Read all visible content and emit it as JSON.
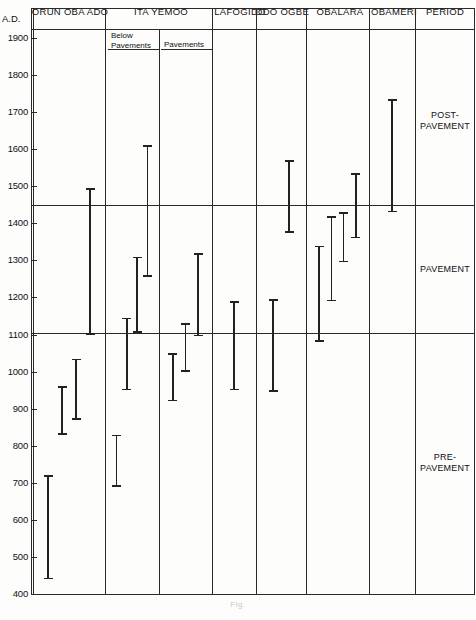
{
  "axis": {
    "unit_label": "A.D.",
    "ticks": [
      1900,
      1800,
      1700,
      1600,
      1500,
      1400,
      1300,
      1200,
      1100,
      1000,
      900,
      800,
      700,
      600,
      500,
      400
    ],
    "min": 400,
    "max": 1900
  },
  "columns": [
    {
      "key": "orun_oba_ado",
      "label": "ORUN OBA ADO",
      "sub": null
    },
    {
      "key": "ita_yemoo_below",
      "label": "ITA YEMOO",
      "sub": "Below\nPavements"
    },
    {
      "key": "ita_yemoo_pav",
      "label": "",
      "sub": "Pavements"
    },
    {
      "key": "lafogido",
      "label": "LAFOGIDO",
      "sub": null
    },
    {
      "key": "odo_ogbe",
      "label": "ODO OGBE",
      "sub": null
    },
    {
      "key": "obalara",
      "label": "OBALARA",
      "sub": null
    },
    {
      "key": "obameri",
      "label": "OBAMERI",
      "sub": null
    },
    {
      "key": "period",
      "label": "PERIOD",
      "sub": null
    }
  ],
  "header": {
    "axis_unit": "A.D.",
    "orun_oba_ado": "ORUN OBA ADO",
    "ita_yemoo": "ITA YEMOO",
    "ita_yemoo_below": "Below",
    "ita_yemoo_below2": "Pavements",
    "ita_yemoo_pavements": "Pavements",
    "lafogido": "LAFOGIDO",
    "odo_ogbe": "ODO OGBE",
    "obalara": "OBALARA",
    "obameri": "OBAMERI",
    "period": "PERIOD"
  },
  "periods": [
    {
      "label": "POST-\nPAVEMENT",
      "line1": "POST-",
      "line2": "PAVEMENT",
      "from": 1900,
      "to": 1450
    },
    {
      "label": "PAVEMENT",
      "line1": "PAVEMENT",
      "line2": "",
      "from": 1450,
      "to": 1105
    },
    {
      "label": "PRE-\nPAVEMENT",
      "line1": "PRE-",
      "line2": "PAVEMENT",
      "from": 1105,
      "to": 400
    }
  ],
  "chart_data": {
    "type": "range",
    "title": "",
    "xlabel": "",
    "ylabel": "A.D.",
    "ylim": [
      400,
      1900
    ],
    "yticks": [
      400,
      500,
      600,
      700,
      800,
      900,
      1000,
      1100,
      1200,
      1300,
      1400,
      1500,
      1600,
      1700,
      1800,
      1900
    ],
    "grid": false,
    "legend": "none",
    "categories": [
      "ORUN OBA ADO",
      "ITA YEMOO (Below Pavements)",
      "ITA YEMOO (Pavements)",
      "LAFOGIDO",
      "ODO OGBE",
      "OBALARA",
      "OBAMERI"
    ],
    "series": [
      {
        "name": "ORUN OBA ADO",
        "column": 0,
        "bars": [
          {
            "low": 440,
            "high": 720
          },
          {
            "low": 830,
            "high": 960
          },
          {
            "low": 870,
            "high": 1035
          },
          {
            "low": 1100,
            "high": 1495
          }
        ]
      },
      {
        "name": "ITA YEMOO (Below Pavements)",
        "column": 1,
        "bars": [
          {
            "low": 690,
            "high": 830
          },
          {
            "low": 950,
            "high": 1145
          },
          {
            "low": 1105,
            "high": 1310
          },
          {
            "low": 1255,
            "high": 1610
          }
        ]
      },
      {
        "name": "ITA YEMOO (Pavements)",
        "column": 2,
        "bars": [
          {
            "low": 920,
            "high": 1050
          },
          {
            "low": 1000,
            "high": 1130
          },
          {
            "low": 1095,
            "high": 1320
          }
        ]
      },
      {
        "name": "LAFOGIDO",
        "column": 3,
        "bars": [
          {
            "low": 950,
            "high": 1190
          }
        ]
      },
      {
        "name": "ODO OGBE",
        "column": 4,
        "bars": [
          {
            "low": 945,
            "high": 1195
          },
          {
            "low": 1375,
            "high": 1570
          }
        ]
      },
      {
        "name": "OBALARA",
        "column": 5,
        "bars": [
          {
            "low": 1080,
            "high": 1340
          },
          {
            "low": 1190,
            "high": 1420
          },
          {
            "low": 1295,
            "high": 1430
          },
          {
            "low": 1360,
            "high": 1535
          }
        ]
      },
      {
        "name": "OBAMERI",
        "column": 6,
        "bars": [
          {
            "low": 1430,
            "high": 1735
          }
        ]
      }
    ]
  },
  "caption": "Fig."
}
